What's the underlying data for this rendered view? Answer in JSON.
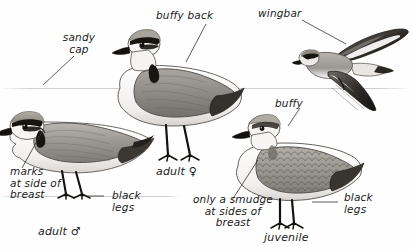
{
  "plate": {
    "title": "Snowy Plover field guide plate",
    "background_color": "#fefefe",
    "ink_color": "#1a1a1a"
  },
  "labels": {
    "sandy_cap": "sandy\ncap",
    "buffy_back": "buffy back",
    "wingbar": "wingbar",
    "buffy": "buffy",
    "marks_at_side_of_breast": "marks\nat side of\nbreast",
    "black_legs_left": "black\nlegs",
    "black_legs_right": "black\nlegs",
    "only_a_smudge": "only a smudge\nat sides of\nbreast"
  },
  "captions": {
    "adult_male": "adult ♂",
    "adult_female": "adult ♀",
    "juvenile": "juvenile"
  },
  "figures": {
    "adult_male_standing": "adult-male-plover-standing",
    "adult_female_standing": "adult-female-plover-standing",
    "juvenile_standing": "juvenile-plover-standing",
    "plover_in_flight": "plover-in-flight"
  }
}
